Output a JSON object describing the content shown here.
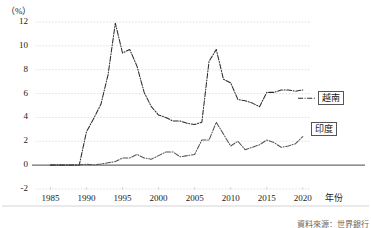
{
  "chart_data": {
    "type": "line",
    "title": "",
    "xlabel": "年份",
    "ylabel": "（%）",
    "unit_label": "（%）",
    "xlim": [
      1983,
      2021
    ],
    "ylim": [
      -2,
      12
    ],
    "ytick_values": [
      -2,
      0,
      2,
      4,
      6,
      8,
      10,
      12
    ],
    "ytick_labels": [
      "-2",
      "0",
      "2",
      "4",
      "6",
      "8",
      "10",
      "12"
    ],
    "xtick_values": [
      1985,
      1990,
      1995,
      2000,
      2005,
      2010,
      2015,
      2020
    ],
    "xtick_labels": [
      "1985",
      "1990",
      "1995",
      "2000",
      "2005",
      "2010",
      "2015",
      "2020"
    ],
    "grid": true,
    "legend_position": "right",
    "x": [
      1985,
      1986,
      1987,
      1988,
      1989,
      1990,
      1991,
      1992,
      1993,
      1994,
      1995,
      1996,
      1997,
      1998,
      1999,
      2000,
      2001,
      2002,
      2003,
      2004,
      2005,
      2006,
      2007,
      2008,
      2009,
      2010,
      2011,
      2012,
      2013,
      2014,
      2015,
      2016,
      2017,
      2018,
      2019,
      2020
    ],
    "series": [
      {
        "name": "越南",
        "label": "越南",
        "color": "#2b2b2b",
        "style": "dash-dot",
        "values": [
          0.0,
          0.0,
          0.0,
          0.0,
          0.0,
          2.8,
          3.9,
          5.1,
          7.6,
          11.9,
          9.4,
          9.7,
          8.3,
          6.1,
          4.9,
          4.2,
          4.0,
          3.7,
          3.7,
          3.5,
          3.4,
          3.6,
          8.7,
          9.7,
          7.2,
          6.9,
          5.5,
          5.4,
          5.2,
          4.9,
          6.1,
          6.1,
          6.3,
          6.3,
          6.2,
          6.3
        ]
      },
      {
        "name": "印度",
        "label": "印度",
        "color": "#555555",
        "style": "dash-dot",
        "values": [
          0.04,
          0.03,
          0.03,
          0.02,
          0.03,
          0.07,
          0.03,
          0.1,
          0.2,
          0.3,
          0.6,
          0.6,
          0.9,
          0.6,
          0.5,
          0.8,
          1.1,
          1.1,
          0.7,
          0.8,
          0.9,
          2.1,
          2.1,
          3.6,
          2.6,
          1.6,
          2.0,
          1.3,
          1.5,
          1.7,
          2.1,
          1.9,
          1.5,
          1.6,
          1.8,
          2.4
        ]
      }
    ],
    "annotations": {
      "source": "資料來源：世界銀行"
    }
  }
}
